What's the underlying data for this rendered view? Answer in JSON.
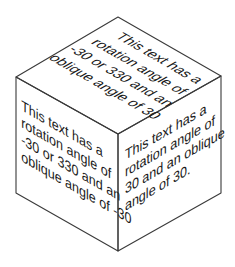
{
  "diagram": {
    "type": "isometric-cube",
    "stroke_color": "#3a3a3a",
    "text_color": "#1a1a1a",
    "background": "#ffffff",
    "vertices": {
      "top": [
        118,
        17
      ],
      "left": [
        16,
        77
      ],
      "right": [
        221,
        76
      ],
      "center": [
        118,
        134
      ],
      "bottom_left": [
        16,
        193
      ],
      "bottom_right": [
        221,
        193
      ],
      "bottom": [
        118,
        251
      ]
    },
    "faces": {
      "top": {
        "lines": [
          "This text has a",
          "rotation angle of",
          "-30 or 330 and an",
          "oblique angle of 30"
        ]
      },
      "left": {
        "lines": [
          "This text has a",
          "rotation angle of",
          "-30 or 330 and an",
          "oblique angle of -30"
        ]
      },
      "right": {
        "lines": [
          "This text has a",
          "rotation angle of",
          "30 and an oblique",
          "angle of 30."
        ]
      }
    }
  }
}
